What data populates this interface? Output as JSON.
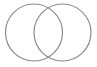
{
  "diagram": {
    "type": "venn",
    "sets": [
      {
        "name": "set-a",
        "label": ""
      },
      {
        "name": "set-b",
        "label": ""
      }
    ],
    "stroke_color": "#8a8a8a",
    "fill_color": "none"
  }
}
